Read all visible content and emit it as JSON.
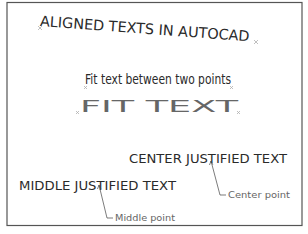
{
  "title": "ALIGNED TEXTS IN AUTOCAD",
  "fit_between_points": "Fit text between two points",
  "fit_text": "FIT  TEXT",
  "center_justified": "CENTER JUSTIFIED TEXT",
  "middle_justified": "MIDDLE JUSTIFIED TEXT",
  "labels": {
    "center_point": "Center point",
    "middle_point": "Middle point"
  },
  "colors": {
    "text": "#2a2a2a",
    "frame": "#555555",
    "markers": "#b0b0b0"
  }
}
